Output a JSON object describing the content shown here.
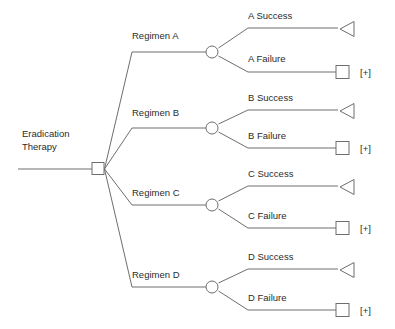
{
  "diagram": {
    "type": "decision-tree",
    "title_node": "Eradication Therapy",
    "root_label_line1": "Eradication",
    "root_label_line2": "Therapy",
    "colors": {
      "line": "#6e6e6e",
      "text": "#2b2b2b",
      "background": "#ffffff",
      "node_fill": "#ffffff"
    },
    "branches": [
      {
        "id": "a",
        "label": "Regimen A",
        "success_label": "A Success",
        "failure_label": "A Failure",
        "collapsed_marker": "[+]",
        "success_terminal": "triangle",
        "failure_terminal": "square"
      },
      {
        "id": "b",
        "label": "Regimen B",
        "success_label": "B Success",
        "failure_label": "B Failure",
        "collapsed_marker": "[+]",
        "success_terminal": "triangle",
        "failure_terminal": "square"
      },
      {
        "id": "c",
        "label": "Regimen C",
        "success_label": "C Success",
        "failure_label": "C Failure",
        "collapsed_marker": "[+]",
        "success_terminal": "triangle",
        "failure_terminal": "square"
      },
      {
        "id": "d",
        "label": "Regimen D",
        "success_label": "D Success",
        "failure_label": "D Failure",
        "collapsed_marker": "[+]",
        "success_terminal": "triangle",
        "failure_terminal": "square"
      }
    ]
  }
}
